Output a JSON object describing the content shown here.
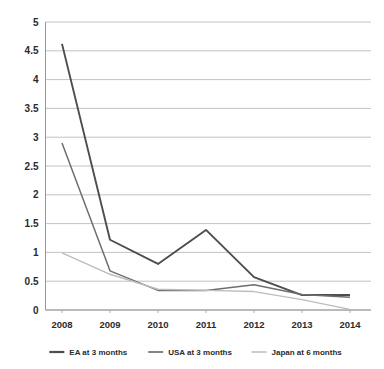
{
  "chart_data": {
    "type": "line",
    "title": "",
    "subtitle": "",
    "xlabel": "",
    "ylabel": "",
    "x": [
      "2008",
      "2009",
      "2010",
      "2011",
      "2012",
      "2013",
      "2014"
    ],
    "categories": [
      "2008",
      "2009",
      "2010",
      "2011",
      "2012",
      "2013",
      "2014"
    ],
    "ylim": [
      0,
      5
    ],
    "ytick_labels": [
      "5",
      "4.5",
      "4",
      "3.5",
      "3",
      "2.5",
      "2",
      "1.5",
      "1",
      "0.5",
      "0"
    ],
    "ytick_values": [
      5,
      4.5,
      4,
      3.5,
      3,
      2.5,
      2,
      1.5,
      1,
      0.5,
      0
    ],
    "grid": "horizontal",
    "legend_position": "bottom",
    "series": [
      {
        "name": "EA at 3 months",
        "color": "#4d4d4d",
        "values": [
          4.62,
          1.22,
          0.8,
          1.39,
          0.57,
          0.26,
          0.26
        ]
      },
      {
        "name": "USA at 3 months",
        "color": "#6e6e6e",
        "values": [
          2.9,
          0.68,
          0.34,
          0.34,
          0.44,
          0.27,
          0.22
        ]
      },
      {
        "name": "Japan at 6 months",
        "color": "#bdbdbd",
        "values": [
          0.99,
          0.62,
          0.36,
          0.34,
          0.32,
          0.18,
          0.01
        ]
      }
    ]
  },
  "legend": {
    "items": [
      {
        "label": "EA at 3 months",
        "color": "#4d4d4d"
      },
      {
        "label": "USA at 3 months",
        "color": "#6e6e6e"
      },
      {
        "label": "Japan at 6 months",
        "color": "#bdbdbd"
      }
    ]
  },
  "axes": {
    "y_labels": [
      "5",
      "4.5",
      "4",
      "3.5",
      "3",
      "2.5",
      "2",
      "1.5",
      "1",
      "0.5",
      "0"
    ],
    "x_labels": [
      "2008",
      "2009",
      "2010",
      "2011",
      "2012",
      "2013",
      "2014"
    ]
  }
}
